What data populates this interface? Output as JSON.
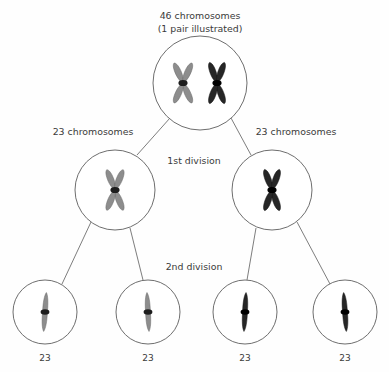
{
  "diagram": {
    "title_line1": "46 chromosomes",
    "title_line2": "(1 pair illustrated)",
    "labels": {
      "left_count": "23 chromosomes",
      "right_count": "23 chromosomes",
      "first_division": "1st division",
      "second_division": "2nd division"
    },
    "gamete_counts": [
      "23",
      "23",
      "23",
      "23"
    ],
    "colors": {
      "maternal_chromosome": "#8d8d8d",
      "paternal_chromosome": "#262626",
      "centromere": "#000000",
      "cell_outline": "#6e6e6e",
      "connector": "#6e6e6e",
      "text": "#3a3a3a",
      "background": "#fefefe"
    },
    "cells": {
      "parent": {
        "name": "parent-cell",
        "cx": 200,
        "cy": 83,
        "r": 47,
        "chromosomes": [
          {
            "type": "replicated-x",
            "color": "gray",
            "cx": 183,
            "cy": 83
          },
          {
            "type": "replicated-x",
            "color": "black",
            "cx": 217,
            "cy": 83
          }
        ]
      },
      "daughters": [
        {
          "name": "daughter-cell-left",
          "cx": 115,
          "cy": 190,
          "r": 40,
          "chromosomes": [
            {
              "type": "replicated-x",
              "color": "gray",
              "cx": 115,
              "cy": 190
            }
          ]
        },
        {
          "name": "daughter-cell-right",
          "cx": 272,
          "cy": 190,
          "r": 40,
          "chromosomes": [
            {
              "type": "replicated-x",
              "color": "black",
              "cx": 272,
              "cy": 190
            }
          ]
        }
      ],
      "gametes": [
        {
          "name": "gamete-cell-1",
          "cx": 45,
          "cy": 312,
          "r": 32,
          "color": "gray"
        },
        {
          "name": "gamete-cell-2",
          "cx": 148,
          "cy": 312,
          "r": 32,
          "color": "gray"
        },
        {
          "name": "gamete-cell-3",
          "cx": 245,
          "cy": 312,
          "r": 32,
          "color": "black"
        },
        {
          "name": "gamete-cell-4",
          "cx": 345,
          "cy": 312,
          "r": 32,
          "color": "black"
        }
      ]
    }
  }
}
